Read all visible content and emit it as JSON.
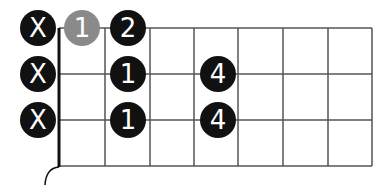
{
  "diagram": {
    "type": "chord-fretboard",
    "strings_shown": 3,
    "frets_shown": 7,
    "colors": {
      "line": "#555555",
      "nut": "#111111",
      "marker_dark": "#111111",
      "marker_grey": "#8a8a8a",
      "marker_text": "#ffffff"
    },
    "muted": [
      {
        "row": 0,
        "label": "X"
      },
      {
        "row": 1,
        "label": "X"
      },
      {
        "row": 2,
        "label": "X"
      }
    ],
    "markers": [
      {
        "row": 0,
        "position": "open",
        "label": "1",
        "style": "grey"
      },
      {
        "row": 0,
        "fret": 1,
        "label": "2",
        "style": "dark"
      },
      {
        "row": 1,
        "fret": 1,
        "label": "1",
        "style": "dark"
      },
      {
        "row": 1,
        "fret": 3,
        "label": "4",
        "style": "dark"
      },
      {
        "row": 2,
        "fret": 1,
        "label": "1",
        "style": "dark"
      },
      {
        "row": 2,
        "fret": 3,
        "label": "4",
        "style": "dark"
      }
    ]
  }
}
